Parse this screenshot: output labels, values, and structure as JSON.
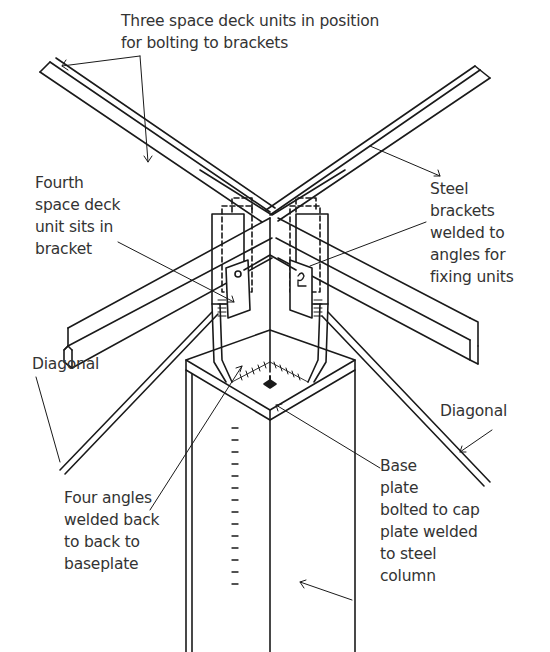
{
  "diagram": {
    "colors": {
      "ink": "#1a1a1a",
      "text": "#333333",
      "background": "#ffffff"
    },
    "labels": [
      {
        "id": "three-units",
        "text": "Three space deck units in position\nfor bolting to brackets",
        "x": 121,
        "y": 10
      },
      {
        "id": "fourth-unit",
        "text": "Fourth\nspace deck\nunit sits in\nbracket",
        "x": 35,
        "y": 172
      },
      {
        "id": "steel-brackets",
        "text": "Steel\nbrackets\nwelded to\nangles for\nfixing units",
        "x": 430,
        "y": 178
      },
      {
        "id": "diagonal-left",
        "text": "Diagonal",
        "x": 32,
        "y": 353
      },
      {
        "id": "diagonal-right",
        "text": "Diagonal",
        "x": 440,
        "y": 400
      },
      {
        "id": "four-angles",
        "text": "Four angles\nwelded back\nto back to\nbaseplate",
        "x": 64,
        "y": 487
      },
      {
        "id": "base-plate",
        "text": "Base\nplate\nbolted to cap\nplate welded\nto steel\ncolumn",
        "x": 380,
        "y": 455
      }
    ]
  }
}
